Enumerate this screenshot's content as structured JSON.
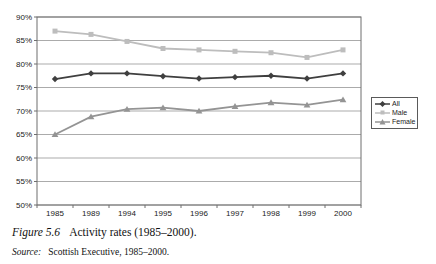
{
  "chart_data": {
    "type": "line",
    "title": "",
    "xlabel": "",
    "ylabel": "",
    "categories": [
      "1985",
      "1989",
      "1994",
      "1995",
      "1996",
      "1997",
      "1998",
      "1999",
      "2000"
    ],
    "series": [
      {
        "name": "All",
        "marker": "diamond",
        "color": "#3f3f3f",
        "values": [
          76.8,
          78.0,
          78.0,
          77.4,
          76.9,
          77.2,
          77.5,
          76.9,
          78.0
        ]
      },
      {
        "name": "Male",
        "marker": "square",
        "color": "#bdbdbd",
        "values": [
          87.0,
          86.3,
          84.8,
          83.3,
          83.0,
          82.7,
          82.4,
          81.4,
          83.0
        ]
      },
      {
        "name": "Female",
        "marker": "triangle",
        "color": "#949494",
        "values": [
          65.0,
          68.8,
          70.4,
          70.7,
          70.0,
          71.0,
          71.8,
          71.3,
          72.4
        ]
      }
    ],
    "ylim": [
      50,
      90
    ],
    "yticks": [
      90,
      85,
      80,
      75,
      70,
      65,
      60,
      55,
      50
    ],
    "ytick_suffix": "%",
    "grid": true,
    "legend_position": "right",
    "colors": {
      "grid": "#ababab",
      "axis": "#6e6e6e"
    }
  },
  "caption": {
    "label": "Figure 5.6",
    "text": "Activity rates (1985–2000)."
  },
  "source": {
    "label": "Source:",
    "text": "Scottish Executive, 1985–2000."
  }
}
